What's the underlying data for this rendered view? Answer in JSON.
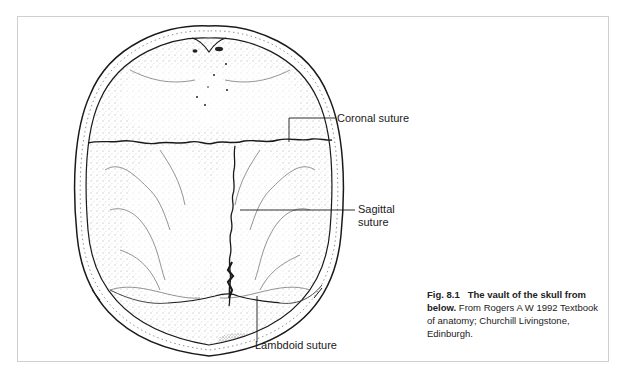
{
  "figure": {
    "number": "Fig. 8.1",
    "title_bold": "The vault of the skull from below.",
    "caption_rest": "From Rogers A W 1992 Textbook of anatomy; Churchill Livingstone, Edinburgh.",
    "labels": {
      "coronal": "Coronal suture",
      "sagittal_line1": "Sagittal",
      "sagittal_line2": "suture",
      "lambdoid": "Lambdoid suture"
    }
  },
  "colors": {
    "frame_border": "#cfcfcf",
    "ink": "#1a1a1a",
    "stipple": "#555555"
  }
}
